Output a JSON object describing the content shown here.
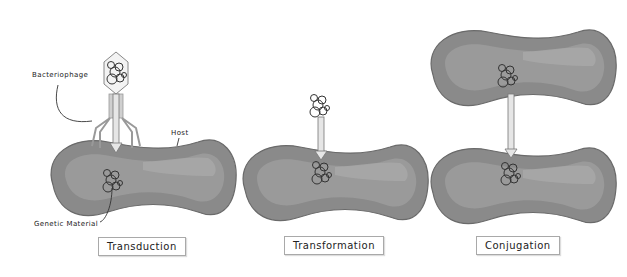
{
  "diagram": {
    "colors": {
      "cell_body": "#8a8a8a",
      "cell_inner": "#9a9a9a",
      "cell_highlight": "#a9a9a9",
      "cell_outline": "#6a6a6a",
      "arrow_fill": "#e6e6e6",
      "arrow_stroke": "#777777",
      "text": "#222222"
    },
    "panels": [
      {
        "id": "transduction",
        "label": "Transduction",
        "annotations": {
          "phage": "Bacteriophage",
          "host": "Host",
          "genetic_material": "Genetic Material"
        }
      },
      {
        "id": "transformation",
        "label": "Transformation"
      },
      {
        "id": "conjugation",
        "label": "Conjugation"
      }
    ]
  }
}
